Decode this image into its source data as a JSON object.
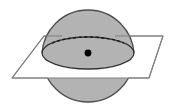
{
  "figure": {
    "title": "Sphere intersected by a plane through its center",
    "canvas": {
      "width": 175,
      "height": 112,
      "background": "#ffffff"
    },
    "colors": {
      "sphere_fill": "#b3b3b3",
      "sphere_outline": "#4d4d4d",
      "plane_fill": "#ffffff",
      "plane_outline": "#808080",
      "great_circle_outline": "#333333",
      "hidden_arc": "#1a1a1a",
      "center_dot": "#000000",
      "band_fill": "#ffffff"
    },
    "sphere": {
      "label": "sphere",
      "center_x": 88,
      "center_y": 56,
      "radius": 46,
      "stroke_width": 1.3
    },
    "plane": {
      "label": "plane",
      "shape": "parallelogram",
      "points": "44,36 163,36 149,78 12,78",
      "stroke_width": 1.1
    },
    "great_circle": {
      "label": "great circle cross-section",
      "center_x": 88,
      "center_y": 53,
      "radius_x": 46,
      "radius_y": 16,
      "stroke_width": 1.3
    },
    "hidden_arc": {
      "label": "hidden back half of great circle",
      "dash_pattern": "3 2.5",
      "stroke_width": 1.4
    },
    "center_point": {
      "label": "center of sphere",
      "x": 88,
      "y": 53,
      "radius": 3.4
    },
    "white_band": {
      "label": "white band between circle and plane edge",
      "top_y": 53,
      "bottom_y": 78
    }
  }
}
